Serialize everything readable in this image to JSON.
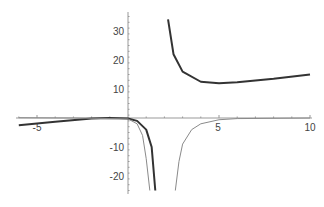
{
  "chart_data": {
    "type": "line",
    "title": "",
    "xlabel": "",
    "ylabel": "",
    "xlim": [
      -6.1,
      10
    ],
    "ylim": [
      -26,
      36
    ],
    "grid": false,
    "legend": null,
    "x_ticks": [
      -5,
      5,
      10
    ],
    "y_ticks": [
      30,
      20,
      10,
      -10,
      -20
    ],
    "x_tick_labels": [
      "-5",
      "5",
      "10"
    ],
    "y_tick_labels": [
      "30",
      "20",
      "10",
      "-10",
      "-20"
    ],
    "series": [
      {
        "name": "dark-curve",
        "color": "#333333",
        "width": 2,
        "points": [
          [
            -6,
            -2.5
          ],
          [
            -4,
            -1.3
          ],
          [
            -2,
            -0.2
          ],
          [
            -1,
            0
          ],
          [
            0,
            -0.2
          ],
          [
            0.5,
            -1
          ],
          [
            1,
            -4
          ],
          [
            1.3,
            -10
          ],
          [
            1.5,
            -25
          ]
        ],
        "points_branch2": [
          [
            2.2,
            34
          ],
          [
            2.5,
            22
          ],
          [
            3,
            16
          ],
          [
            4,
            12.5
          ],
          [
            5,
            12
          ],
          [
            6,
            12.3
          ],
          [
            8,
            13.5
          ],
          [
            10,
            15
          ]
        ]
      },
      {
        "name": "gray-curve",
        "color": "#8a8a8a",
        "width": 1,
        "points": [
          [
            -6,
            0.1
          ],
          [
            -3,
            0
          ],
          [
            0,
            -0.3
          ],
          [
            0.5,
            -2
          ],
          [
            0.8,
            -6
          ],
          [
            1.0,
            -14
          ],
          [
            1.2,
            -25
          ]
        ],
        "points_branch2": [
          [
            2.6,
            -25
          ],
          [
            2.8,
            -15
          ],
          [
            3,
            -9
          ],
          [
            3.5,
            -4
          ],
          [
            4,
            -2
          ],
          [
            5,
            -0.6
          ],
          [
            6,
            -0.2
          ],
          [
            10,
            0
          ]
        ]
      }
    ]
  }
}
